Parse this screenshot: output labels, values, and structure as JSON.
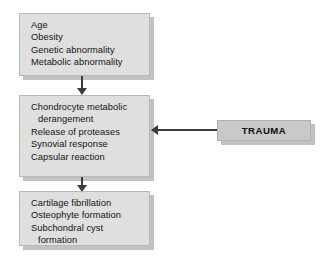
{
  "diagram": {
    "colors": {
      "node_fill": "#dfdfdf",
      "node_border": "#b9b9b9",
      "node_shadow": "#c2c2c2",
      "trauma_fill": "#c9c9c9",
      "arrow": "#3b3b3b",
      "text": "#141414",
      "background": "#ffffff"
    },
    "nodes": [
      {
        "id": "risk-factors",
        "lines": [
          {
            "text": "Age",
            "indent": false
          },
          {
            "text": "Obesity",
            "indent": false
          },
          {
            "text": "Genetic abnormality",
            "indent": false
          },
          {
            "text": "Metabolic abnormality",
            "indent": false
          }
        ]
      },
      {
        "id": "cartilage-pathology",
        "lines": [
          {
            "text": "Chondrocyte metabolic",
            "indent": false
          },
          {
            "text": "derangement",
            "indent": true
          },
          {
            "text": "Release of proteases",
            "indent": false
          },
          {
            "text": "Synovial response",
            "indent": false
          },
          {
            "text": "Capsular reaction",
            "indent": false
          }
        ]
      },
      {
        "id": "structural-changes",
        "lines": [
          {
            "text": "Cartilage fibrillation",
            "indent": false
          },
          {
            "text": "Osteophyte formation",
            "indent": false
          },
          {
            "text": "Subchondral cyst",
            "indent": false
          },
          {
            "text": "formation",
            "indent": true
          }
        ]
      }
    ],
    "trauma": {
      "label": "TRAUMA"
    },
    "edges": [
      {
        "id": "risk-to-pathology",
        "direction": "down"
      },
      {
        "id": "pathology-to-structural",
        "direction": "down"
      },
      {
        "id": "trauma-to-pathology",
        "direction": "left"
      }
    ]
  }
}
